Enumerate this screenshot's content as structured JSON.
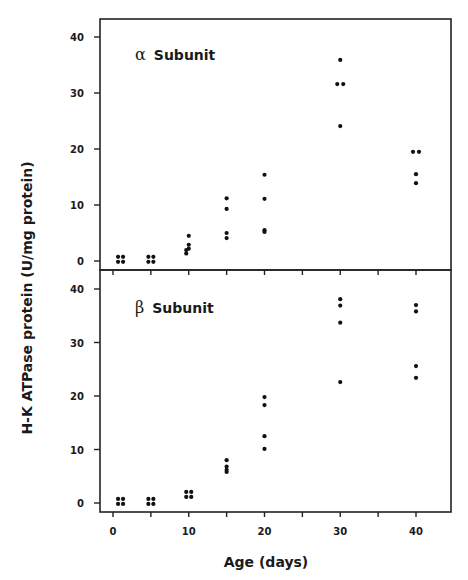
{
  "chart_data": {
    "type": "scatter",
    "layout": "two vertically stacked panels sharing x axis",
    "xlabel": "Age (days)",
    "ylabel": "H-K ATPase protein (U/mg protein)",
    "xlim": [
      -3,
      45
    ],
    "xticks": [
      0,
      5,
      10,
      15,
      20,
      25,
      30,
      35,
      40
    ],
    "xtick_labels": [
      "0",
      "10",
      "20",
      "30",
      "40"
    ],
    "grid": false,
    "legend": null,
    "panels": [
      {
        "name": "alpha",
        "title_greek": "α",
        "title_text": "Subunit",
        "title": "α Subunit",
        "ylim": [
          -1.5,
          44
        ],
        "yticks": [
          0,
          10,
          20,
          30,
          40
        ],
        "ytick_labels": [
          "0",
          "10",
          "20",
          "30",
          "40"
        ],
        "points": [
          {
            "x": 1,
            "y": 0.3
          },
          {
            "x": 1,
            "y": 0.3
          },
          {
            "x": 1,
            "y": 0.3
          },
          {
            "x": 1,
            "y": 0.3
          },
          {
            "x": 5,
            "y": 0.3
          },
          {
            "x": 5,
            "y": 0.3
          },
          {
            "x": 5,
            "y": 0.3
          },
          {
            "x": 5,
            "y": 0.3
          },
          {
            "x": 10,
            "y": 4.5
          },
          {
            "x": 10,
            "y": 2.9
          },
          {
            "x": 10,
            "y": 2.2
          },
          {
            "x": 10,
            "y": 1.5
          },
          {
            "x": 10,
            "y": 0.9
          },
          {
            "x": 15,
            "y": 11.2
          },
          {
            "x": 15,
            "y": 9.3
          },
          {
            "x": 15,
            "y": 5.0
          },
          {
            "x": 15,
            "y": 4.1
          },
          {
            "x": 20,
            "y": 15.4
          },
          {
            "x": 20,
            "y": 11.1
          },
          {
            "x": 20,
            "y": 5.5
          },
          {
            "x": 20,
            "y": 5.2
          },
          {
            "x": 30,
            "y": 35.9
          },
          {
            "x": 30,
            "y": 31.6
          },
          {
            "x": 30,
            "y": 31.6
          },
          {
            "x": 30,
            "y": 24.1
          },
          {
            "x": 40,
            "y": 19.5
          },
          {
            "x": 40,
            "y": 19.5
          },
          {
            "x": 40,
            "y": 15.5
          },
          {
            "x": 40,
            "y": 13.9
          }
        ]
      },
      {
        "name": "beta",
        "title_greek": "β",
        "title_text": "Subunit",
        "title": "β Subunit",
        "ylim": [
          -1.7,
          41.5
        ],
        "yticks": [
          0,
          10,
          20,
          30,
          40
        ],
        "ytick_labels": [
          "0",
          "10",
          "20",
          "30",
          "40"
        ],
        "points": [
          {
            "x": 1,
            "y": 0.3
          },
          {
            "x": 1,
            "y": 0.3
          },
          {
            "x": 1,
            "y": 0.3
          },
          {
            "x": 1,
            "y": 0.3
          },
          {
            "x": 5,
            "y": 0.3
          },
          {
            "x": 5,
            "y": 0.3
          },
          {
            "x": 5,
            "y": 0.3
          },
          {
            "x": 5,
            "y": 0.3
          },
          {
            "x": 10,
            "y": 1.6
          },
          {
            "x": 10,
            "y": 1.6
          },
          {
            "x": 10,
            "y": 1.6
          },
          {
            "x": 10,
            "y": 1.6
          },
          {
            "x": 15,
            "y": 8.0
          },
          {
            "x": 15,
            "y": 6.8
          },
          {
            "x": 15,
            "y": 6.2
          },
          {
            "x": 15,
            "y": 5.8
          },
          {
            "x": 20,
            "y": 19.8
          },
          {
            "x": 20,
            "y": 18.3
          },
          {
            "x": 20,
            "y": 12.5
          },
          {
            "x": 20,
            "y": 10.1
          },
          {
            "x": 30,
            "y": 38.1
          },
          {
            "x": 30,
            "y": 36.9
          },
          {
            "x": 30,
            "y": 33.7
          },
          {
            "x": 30,
            "y": 22.6
          },
          {
            "x": 40,
            "y": 37.0
          },
          {
            "x": 40,
            "y": 35.8
          },
          {
            "x": 40,
            "y": 25.6
          },
          {
            "x": 40,
            "y": 23.4
          }
        ]
      }
    ]
  }
}
